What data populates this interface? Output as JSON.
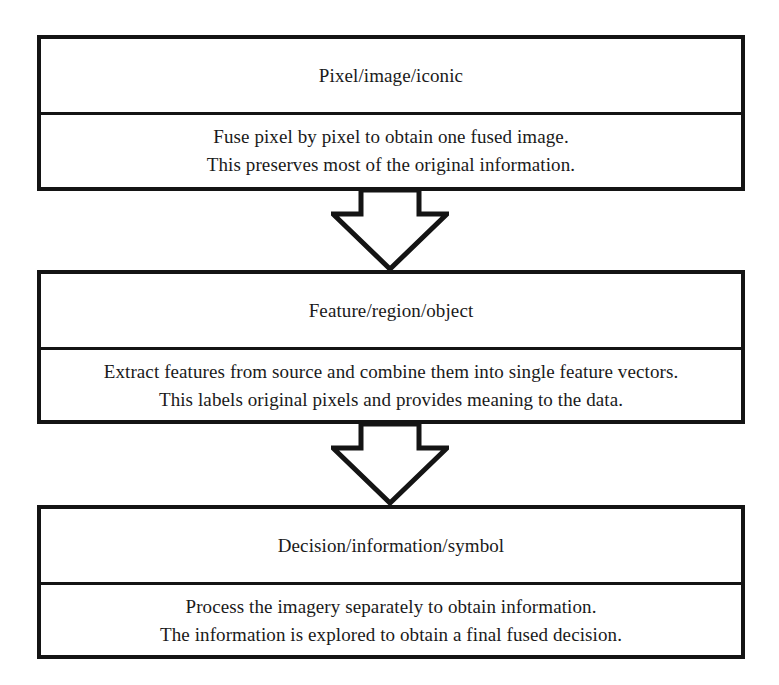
{
  "diagram": {
    "background_color": "#ffffff",
    "stroke_color": "#141414",
    "levels": [
      {
        "id": "pixel-level",
        "title": "Pixel/image/iconic",
        "lines": [
          "Fuse pixel by pixel to obtain one fused image.",
          "This preserves most of the original information."
        ]
      },
      {
        "id": "feature-level",
        "title": "Feature/region/object",
        "lines": [
          "Extract features from source and combine them into single feature vectors.",
          "This labels original pixels and provides meaning to the data."
        ]
      },
      {
        "id": "decision-level",
        "title": "Decision/information/symbol",
        "lines": [
          "Process the imagery separately to obtain information.",
          "The information is explored to obtain a final fused decision."
        ]
      }
    ],
    "connectors": [
      {
        "id": "arrow-pixel-to-feature",
        "icon": "arrow-down-block-icon",
        "from": "pixel-level",
        "to": "feature-level"
      },
      {
        "id": "arrow-feature-to-decision",
        "icon": "arrow-down-block-icon",
        "from": "feature-level",
        "to": "decision-level"
      }
    ]
  }
}
